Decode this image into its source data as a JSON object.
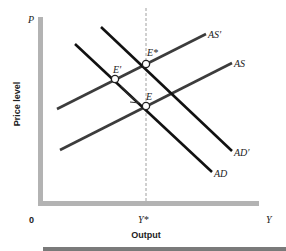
{
  "diagram": {
    "type": "AD-AS macroeconomic model",
    "axes": {
      "y_axis_symbol": "P",
      "y_axis_label": "Price level",
      "x_axis_symbol": "Y",
      "x_axis_label": "Output",
      "origin": "0",
      "x_tick": "Y*"
    },
    "curves": {
      "as_prime": "AS′",
      "as": "AS",
      "ad_prime": "AD′",
      "ad": "AD"
    },
    "points": {
      "e_star": "E*",
      "e_prime": "E′",
      "e": "E"
    },
    "colors": {
      "axis": "#b3b3b3",
      "as_curves": "#3c3c3c",
      "ad_curves": "#111111",
      "dashed": "#a0a0a0",
      "bottom_bar": "#7a7a7a"
    }
  }
}
